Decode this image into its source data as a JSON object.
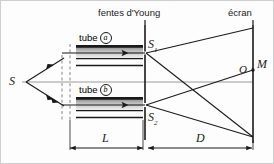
{
  "figure": {
    "kind": "optics-diagram",
    "background_color": "#fdfdfd",
    "stroke_color": "#1a1a1a",
    "tube_fill_top": "#8e8e8e",
    "tube_fill_bottom": "#e8e8e8",
    "axis_gray": "#9a9a9a"
  },
  "labels": {
    "slits_title": "fentes d'Young",
    "screen_title": "écran",
    "source": "S",
    "slit_top": "S",
    "slit_top_sub": "1",
    "slit_bottom": "S",
    "slit_bottom_sub": "2",
    "center_point": "O",
    "observation_point": "M",
    "tube_a_word": "tube",
    "tube_a_mark": "a",
    "tube_b_word": "tube",
    "tube_b_mark": "b",
    "dim_tube_length": "L",
    "dim_slit_screen": "D"
  },
  "geometry": {
    "source_x": 22,
    "source_y": 82,
    "dashed_x1": 62,
    "dashed_x2": 70,
    "barrier_x": 145,
    "screen_x": 253,
    "slit_top_y": 60,
    "slit_bottom_y": 105,
    "axis_y": 82,
    "tube_left": 76,
    "tube_right": 143,
    "dim_L_y": 148,
    "dim_D_y": 148
  }
}
